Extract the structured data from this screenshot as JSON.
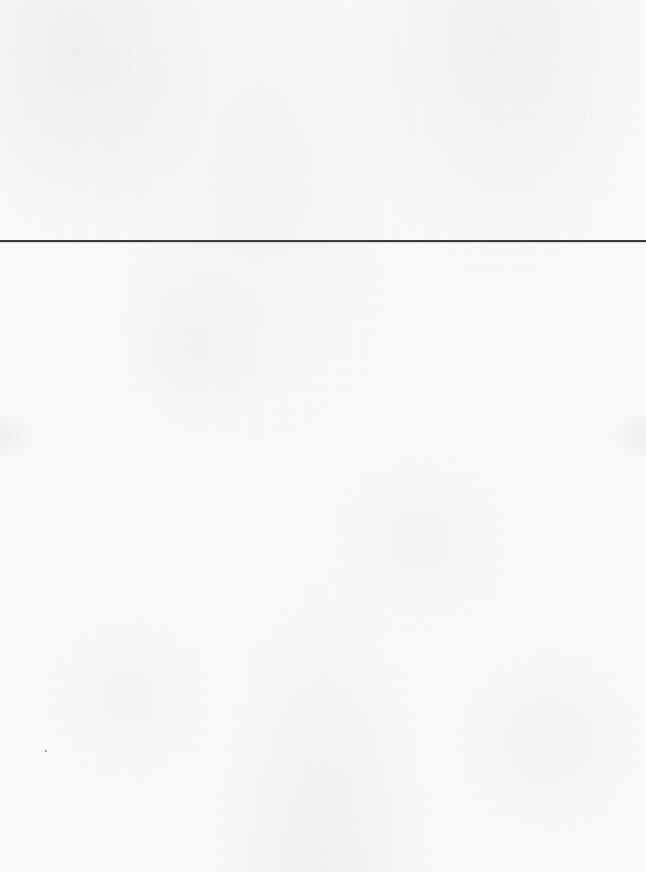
{
  "page": {
    "background_color": "#f9f9f9",
    "texture": "scanned-paper-grain"
  },
  "rule": {
    "color": "#3c3c3c",
    "y": 241,
    "thickness": 2
  },
  "speck": {
    "x": 45,
    "y": 750,
    "color": "#8a8a8a"
  }
}
